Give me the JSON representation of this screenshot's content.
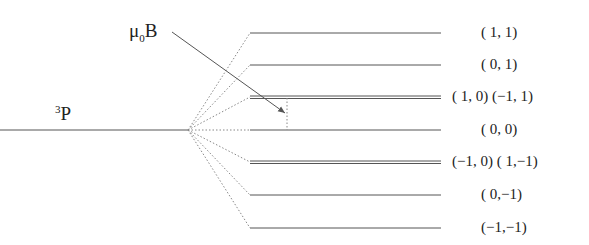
{
  "diagram": {
    "term_label": {
      "main": "P",
      "superscript": "3"
    },
    "field_label": {
      "mu": "μ",
      "subscript": "0",
      "B": "B"
    },
    "levels": [
      {
        "y": 33,
        "label": "( 1, 1)",
        "double": false
      },
      {
        "y": 65,
        "label": "( 0, 1)",
        "double": false
      },
      {
        "y": 97,
        "label": "( 1, 0)   (−1, 1)",
        "double": true
      },
      {
        "y": 130,
        "label": "( 0, 0)",
        "double": false
      },
      {
        "y": 162,
        "label": "(−1, 0)  ( 1,−1)",
        "double": true
      },
      {
        "y": 195,
        "label": "( 0,−1)",
        "double": false
      },
      {
        "y": 228,
        "label": "(−1,−1)",
        "double": false
      }
    ],
    "colors": {
      "line": "#555555",
      "dotted": "#888888"
    }
  }
}
